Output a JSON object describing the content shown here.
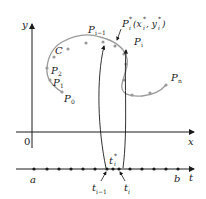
{
  "diagram": {
    "axes": {
      "y_label": "y",
      "x_label": "x",
      "origin_label": "0",
      "t_label": "t"
    },
    "curve": {
      "name": "C",
      "color": "#9a9a9a",
      "points": {
        "p0": "P",
        "p0_sub": "0",
        "p1": "P",
        "p1_sub": "1",
        "p2": "P",
        "p2_sub": "2",
        "pim1": "P",
        "pim1_sub": "i−1",
        "pi": "P",
        "pi_sub": "i",
        "pn": "P",
        "pn_sub": "n",
        "pstar": "P",
        "pstar_sup": "*",
        "pstar_sub": "i",
        "pstar_coords": "(x",
        "pstar_coords_x_sup": "*",
        "pstar_coords_x_sub": "i",
        "pstar_coords_sep": ", y",
        "pstar_coords_y_sup": "*",
        "pstar_coords_y_sub": "i",
        "pstar_coords_close": ")"
      }
    },
    "t_axis": {
      "a_label": "a",
      "b_label": "b",
      "tstar": "t",
      "tstar_sup": "*",
      "tstar_sub": "i",
      "tim1": "t",
      "tim1_sub": "i−1",
      "ti": "t",
      "ti_sub": "i"
    }
  }
}
